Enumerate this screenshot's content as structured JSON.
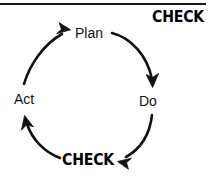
{
  "diagram": {
    "title_text": "CHECK",
    "type": "pdca-cycle",
    "nodes": [
      {
        "id": "plan",
        "label": "Plan",
        "x": 90,
        "y": 33
      },
      {
        "id": "do",
        "label": "Do",
        "x": 148,
        "y": 101
      },
      {
        "id": "check",
        "label": "CHECK",
        "x": 90,
        "y": 160
      },
      {
        "id": "act",
        "label": "Act",
        "x": 27,
        "y": 99
      }
    ],
    "header": {
      "label": "CHECK",
      "rule_color": "#1a1a1a"
    },
    "arrows": [
      {
        "id": "plan-to-do",
        "from": "plan",
        "to": "do",
        "direction": "clockwise"
      },
      {
        "id": "do-to-check",
        "from": "do",
        "to": "check",
        "direction": "clockwise"
      },
      {
        "id": "check-to-act",
        "from": "check",
        "to": "act",
        "direction": "clockwise"
      },
      {
        "id": "act-to-plan",
        "from": "act",
        "to": "plan",
        "direction": "clockwise"
      }
    ],
    "colors": {
      "stroke": "#111111",
      "text": "#111111",
      "emphasis_text": "#000000",
      "background": "#ffffff"
    }
  }
}
